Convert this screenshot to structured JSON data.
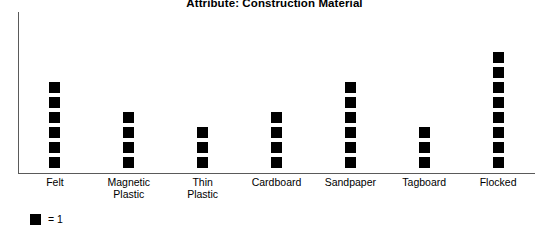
{
  "chart_data": {
    "type": "bar",
    "subtype": "pictograph",
    "title": "Attribute: Construction Material",
    "xlabel": "",
    "ylabel": "",
    "categories": [
      "Felt",
      "Magnetic Plastic",
      "Thin Plastic",
      "Cardboard",
      "Sandpaper",
      "Tagboard",
      "Flocked"
    ],
    "category_lines": [
      [
        "Felt"
      ],
      [
        "Magnetic",
        "Plastic"
      ],
      [
        "Thin",
        "Plastic"
      ],
      [
        "Cardboard"
      ],
      [
        "Sandpaper"
      ],
      [
        "Tagboard"
      ],
      [
        "Flocked"
      ]
    ],
    "values": [
      6,
      4,
      3,
      4,
      6,
      3,
      8
    ],
    "ylim": [
      0,
      9
    ],
    "grid": false,
    "legend_position": "bottom-left",
    "unit_value": 1,
    "unit_symbol": "black-square",
    "marker_color": "#000000",
    "axis_color": "#5a5a5a",
    "background_color": "#ffffff"
  },
  "legend": {
    "equals_label": "= 1"
  }
}
